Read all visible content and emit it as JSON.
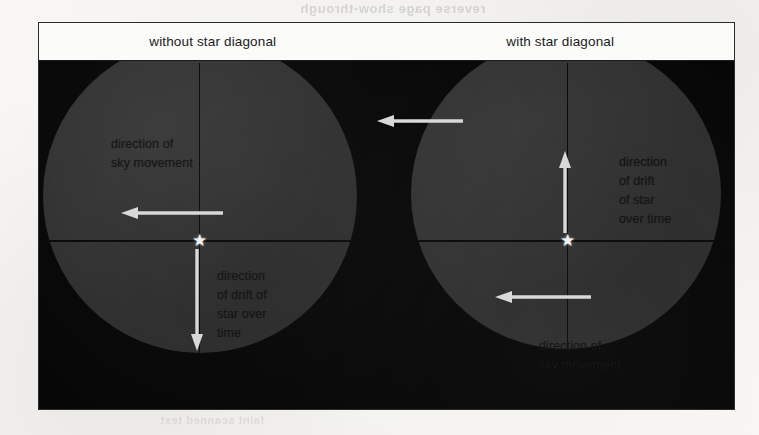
{
  "figure": {
    "headers": [
      {
        "label": "without star diagonal"
      },
      {
        "label": "with star diagonal"
      }
    ],
    "page_bleed": {
      "line_top": "reverse page show-through",
      "line_inner": "faint scanned text",
      "line_bottom": "faint scanned text"
    },
    "panels": [
      {
        "id": "without-star-diagonal",
        "star_glyph": "★",
        "captions": {
          "sky_movement": "direction of\nsky movement",
          "star_drift": "direction\nof drift of\nstar over\ntime"
        },
        "arrows": {
          "sky_movement_direction": "left",
          "star_drift_direction": "down"
        }
      },
      {
        "id": "with-star-diagonal",
        "star_glyph": "★",
        "captions": {
          "star_drift": "direction\nof drift\nof star\nover time",
          "sky_movement": "direction of\nsky movement"
        },
        "arrows": {
          "star_drift_direction": "up",
          "sky_movement_direction": "left"
        }
      }
    ],
    "between_arrow": {
      "direction": "left"
    },
    "colors": {
      "paper": "#f6f5f3",
      "frame_border": "#2b2b2b",
      "header_background": "#fbfbfa",
      "sky_background": "#070707",
      "eyepiece_fill": "#2f2f2f",
      "arrow_stroke": "#d8d8d8",
      "star_fill": "#f2f2f2",
      "caption_text": "#111111",
      "crosshair": "#080808"
    }
  }
}
